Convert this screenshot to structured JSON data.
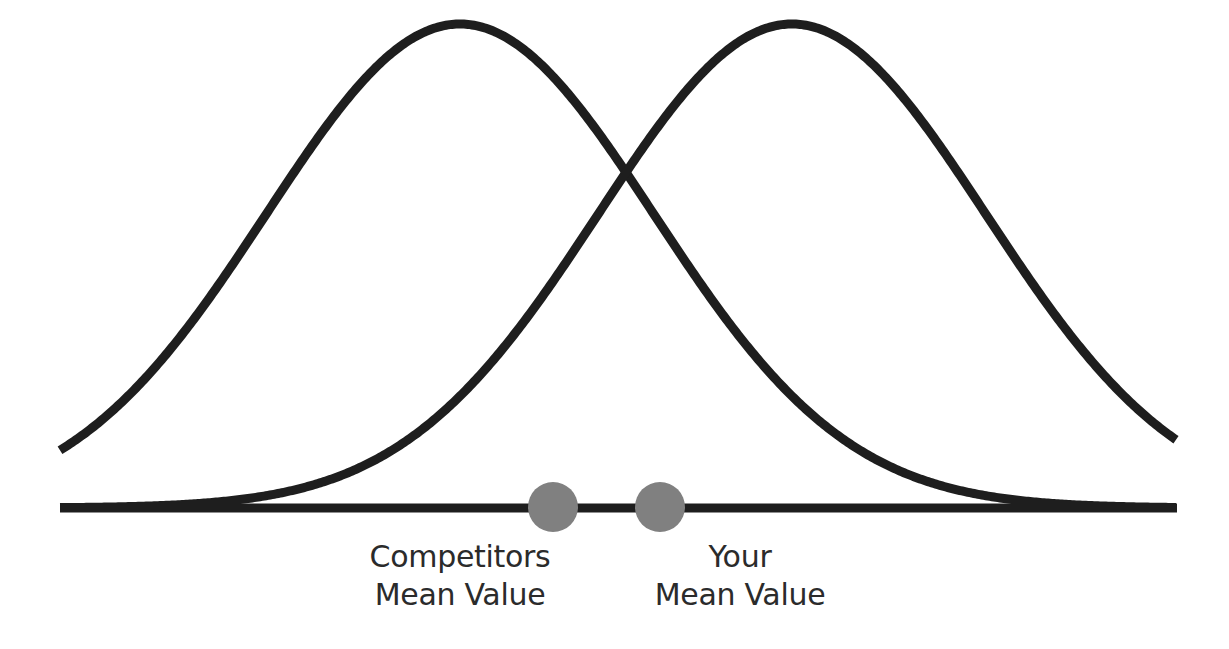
{
  "colors": {
    "background": "#ffffff",
    "curve": "#1e1e1e",
    "baseline": "#1e1e1e",
    "marker": "#808080",
    "text": "#2b2b2b"
  },
  "labels": {
    "competitors": {
      "line1": "Competitors",
      "line2": "Mean Value"
    },
    "yours": {
      "line1": "Your",
      "line2": "Mean Value"
    }
  },
  "chart_data": {
    "type": "line",
    "title": "",
    "series": [
      {
        "name": "Competitors distribution",
        "mean_px": 460,
        "sigma_px": 194,
        "peak_y_px": 24
      },
      {
        "name": "Your distribution",
        "mean_px": 792,
        "sigma_px": 194,
        "peak_y_px": 24
      }
    ],
    "baseline": {
      "x_start": 60,
      "x_end": 1177,
      "y": 508,
      "thickness": 9
    },
    "markers": [
      {
        "name": "Competitors Mean Value",
        "cx": 553,
        "cy": 507,
        "r": 25
      },
      {
        "name": "Your Mean Value",
        "cx": 660,
        "cy": 507,
        "r": 25
      }
    ],
    "x_range_px": [
      60,
      1177
    ],
    "grid": false,
    "legend": "none"
  }
}
